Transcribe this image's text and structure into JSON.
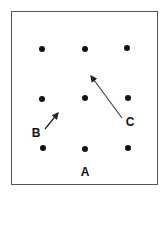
{
  "diagram": {
    "border_color": "#555555",
    "dot_color": "#111111",
    "dots": [
      {
        "x": 42,
        "y": 49
      },
      {
        "x": 85,
        "y": 49
      },
      {
        "x": 127,
        "y": 48
      },
      {
        "x": 42,
        "y": 99
      },
      {
        "x": 85,
        "y": 98
      },
      {
        "x": 128,
        "y": 98
      },
      {
        "x": 43,
        "y": 148
      },
      {
        "x": 85,
        "y": 149
      },
      {
        "x": 128,
        "y": 148
      }
    ],
    "labels": {
      "a": "A",
      "b": "B",
      "c": "C"
    },
    "arrows": {
      "b": {
        "from": [
          45,
          129
        ],
        "to": [
          58,
          113
        ]
      },
      "c": {
        "from": [
          122,
          118
        ],
        "to": [
          91,
          76
        ]
      }
    }
  }
}
